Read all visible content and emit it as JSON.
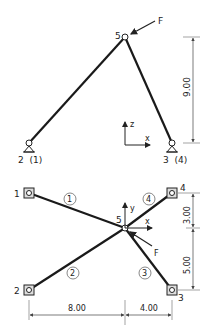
{
  "top_view": {
    "node5_label": "5",
    "force_label": "F",
    "support_left_label": "2  (1)",
    "support_right_label": "3  (4)",
    "dim_vertical": "9.00",
    "axis_z": "z",
    "axis_x": "x"
  },
  "plan_view": {
    "node_labels": {
      "n1": "1",
      "n2": "2",
      "n3": "3",
      "n4": "4",
      "n5": "5"
    },
    "member_labels": {
      "m1": "1",
      "m2": "2",
      "m3": "3",
      "m4": "4"
    },
    "force_label": "F",
    "axis_y": "y",
    "axis_x": "x",
    "dim_top": "3.00",
    "dim_bottom": "5.00",
    "dim_left": "8.00",
    "dim_right": "4.00"
  },
  "colors": {
    "member": "#1a1a1a",
    "dim": "#444444"
  }
}
